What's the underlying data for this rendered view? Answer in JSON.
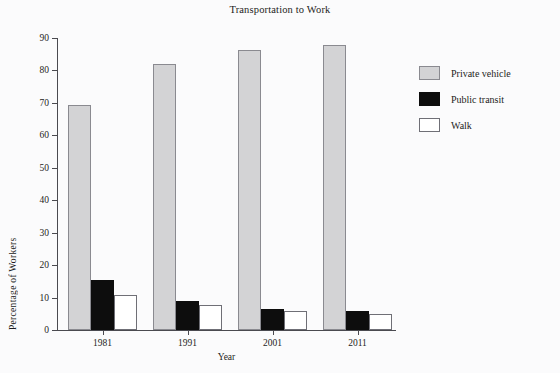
{
  "chart_data": {
    "type": "bar",
    "title": "Transportation to Work",
    "xlabel": "Year",
    "ylabel": "Percentage of Workers",
    "categories": [
      "1981",
      "1991",
      "2001",
      "2011"
    ],
    "series": [
      {
        "name": "Private vehicle",
        "values": [
          69.3,
          82.0,
          86.3,
          88.0
        ],
        "color": "#d3d3d5"
      },
      {
        "name": "Public transit",
        "values": [
          15.3,
          8.9,
          6.4,
          5.9
        ],
        "color": "#0d0d0d"
      },
      {
        "name": "Walk",
        "values": [
          10.8,
          7.7,
          5.9,
          5.0
        ],
        "color": "#ffffff"
      }
    ],
    "ylim": [
      0,
      90
    ],
    "yticks": [
      "0",
      "10",
      "20",
      "30",
      "40",
      "50",
      "60",
      "70",
      "80",
      "90"
    ],
    "ytick_values": [
      0,
      10,
      20,
      30,
      40,
      50,
      60,
      70,
      80,
      90
    ],
    "grid": false,
    "legend_position": "right"
  },
  "legend": {
    "entries": [
      {
        "label": "Private vehicle",
        "swatch": "private"
      },
      {
        "label": "Public transit",
        "swatch": "transit"
      },
      {
        "label": "Walk",
        "swatch": "walk"
      }
    ]
  }
}
